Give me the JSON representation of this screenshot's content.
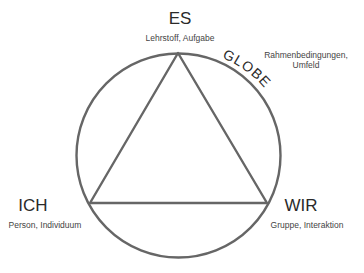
{
  "diagram": {
    "type": "TZI triangle in circle (Themenzentrierte Interaktion)",
    "colors": {
      "stroke": "#666666",
      "text": "#2a2a2a",
      "background": "#ffffff"
    },
    "nodes": {
      "es": {
        "title": "ES",
        "subtitle": "Lehrstoff, Aufgabe"
      },
      "ich": {
        "title": "ICH",
        "subtitle": "Person, Individuum"
      },
      "wir": {
        "title": "WIR",
        "subtitle": "Gruppe, Interaktion"
      }
    },
    "globe": {
      "title": "GLOBE",
      "subtitle_line1": "Rahmenbedingungen,",
      "subtitle_line2": "Umfeld"
    }
  }
}
